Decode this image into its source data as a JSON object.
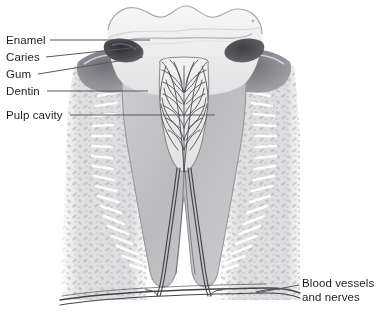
{
  "figure": {
    "kind": "anatomical-illustration",
    "style": "grayscale pencil/airbrush medical illustration",
    "background_color": "#ffffff",
    "text_color": "#1d1d1d",
    "leader_line_color": "#59595b",
    "width": 368,
    "height": 317
  },
  "labels": {
    "left": [
      {
        "id": "enamel",
        "text": "Enamel",
        "x": 6,
        "y": 34,
        "leader": {
          "x1": 50,
          "y1": 40,
          "x2": 150,
          "y2": 40
        }
      },
      {
        "id": "caries",
        "text": "Caries",
        "x": 6,
        "y": 51,
        "leader": {
          "x1": 46,
          "y1": 57,
          "x2": 140,
          "y2": 47
        }
      },
      {
        "id": "gum",
        "text": "Gum",
        "x": 6,
        "y": 68,
        "leader": {
          "x1": 38,
          "y1": 74,
          "x2": 143,
          "y2": 57
        }
      },
      {
        "id": "dentin",
        "text": "Dentin",
        "x": 6,
        "y": 85,
        "leader": {
          "x1": 47,
          "y1": 91,
          "x2": 148,
          "y2": 91
        }
      },
      {
        "id": "pulp-cavity",
        "text": "Pulp cavity",
        "x": 6,
        "y": 109,
        "leader": {
          "x1": 70,
          "y1": 115,
          "x2": 215,
          "y2": 115
        }
      }
    ],
    "right": [
      {
        "id": "blood-vessels-and-nerves",
        "line1": "Blood vessels",
        "line2": "and nerves",
        "x": 302,
        "y": 278,
        "leader": {
          "x1": 256,
          "y1": 293,
          "x2": 299,
          "y2": 285
        }
      }
    ]
  },
  "anatomy": {
    "crown": {
      "name": "crown",
      "fill": "#efefef"
    },
    "enamel": {
      "name": "enamel",
      "fill": "#e9e9ea"
    },
    "dentin": {
      "name": "dentin",
      "fill": "#c9c9cb"
    },
    "pulp": {
      "name": "pulp cavity",
      "fill": "#ededee"
    },
    "gum": {
      "name": "gum",
      "fill": "#8e8e92"
    },
    "caries": {
      "name": "caries lesion",
      "fill": "#4a4a4f"
    },
    "bone": {
      "name": "alveolar bone",
      "fill": "#dcdcdd"
    },
    "ligament": {
      "name": "periodontal ligament",
      "fill": "#ffffff"
    },
    "vessels": {
      "name": "blood vessels and nerves",
      "stroke": "#3a3a40"
    },
    "roots": 2
  }
}
